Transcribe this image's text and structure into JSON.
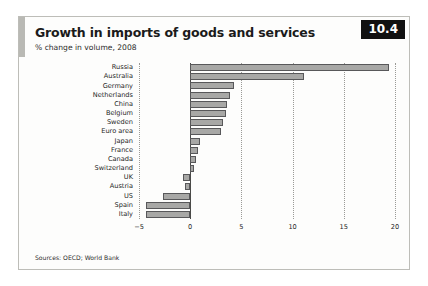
{
  "figure": {
    "number_badge": "10.4",
    "title": "Growth in imports of goods and services",
    "subtitle": "% change in volume, 2008",
    "source": "Sources: OECD; World Bank"
  },
  "chart_data": {
    "type": "bar",
    "orientation": "horizontal",
    "title": "Growth in imports of goods and services",
    "subtitle": "% change in volume, 2008",
    "xlabel": "",
    "ylabel": "",
    "xlim": [
      -5,
      20
    ],
    "xticks": [
      -5,
      0,
      5,
      10,
      15,
      20
    ],
    "xtick_labels": [
      "−5",
      "0",
      "5",
      "10",
      "15",
      "20"
    ],
    "grid": true,
    "grid_style": "dotted vertical",
    "legend": "none",
    "bar_fill_color": "#a8a8a6",
    "bar_edge_color": "#58585a",
    "categories": [
      "Russia",
      "Australia",
      "Germany",
      "Netherlands",
      "China",
      "Belgium",
      "Sweden",
      "Euro area",
      "Japan",
      "France",
      "Canada",
      "Switzerland",
      "UK",
      "Austria",
      "US",
      "Spain",
      "Italy"
    ],
    "values": [
      19.4,
      11.1,
      4.3,
      3.9,
      3.6,
      3.5,
      3.2,
      3.0,
      1.0,
      0.8,
      0.6,
      0.4,
      -0.7,
      -0.5,
      -2.7,
      -4.3,
      -4.3
    ],
    "source": "Sources: OECD; World Bank"
  }
}
